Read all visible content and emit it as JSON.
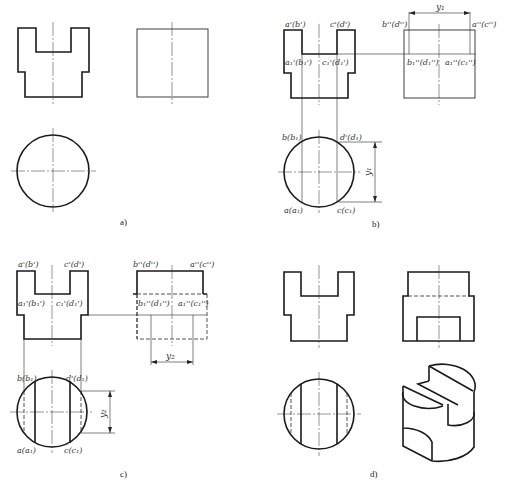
{
  "figure": {
    "panels": [
      {
        "id": "a",
        "caption": "a)"
      },
      {
        "id": "b",
        "caption": "b)",
        "front_labels": [
          "a'(b')",
          "c'(d')",
          "a1'(b1')",
          "c1'(d1')"
        ],
        "side_labels": [
          "b''(d'')",
          "a''(c'')",
          "b1''(d1'')",
          "a1''(c1'')"
        ],
        "top_labels": [
          "b(b1)",
          "d(d1)",
          "a(a1)",
          "c(c1)"
        ],
        "dimension": "y1"
      },
      {
        "id": "c",
        "caption": "c)",
        "front_labels": [
          "a'(b')",
          "c'(d')",
          "a1'(b1')",
          "c1'(d1')"
        ],
        "side_labels": [
          "b''(d'')",
          "a''(c'')",
          "b1''(d1'')",
          "a1''(c1'')"
        ],
        "top_labels": [
          "b(b1)",
          "d(d1)",
          "a(a1)",
          "c(c1)"
        ],
        "dimension": "y2"
      },
      {
        "id": "d",
        "caption": "d)"
      }
    ]
  },
  "labels": {
    "b": {
      "ap_bp": "a'(b')",
      "cp_dp": "c'(d')",
      "a1p_b1p": "a₁'(b₁')",
      "c1p_d1p": "c₁'(d₁')",
      "bpp_dpp": "b''(d'')",
      "app_cpp": "a''(c'')",
      "b1pp_d1pp": "b₁''(d₁'')",
      "a1pp_c1pp": "a₁''(c₁'')",
      "b_b1": "b(b₁)",
      "d_d1": "d'(d₁)",
      "a_a1": "a(a₁)",
      "c_c1": "c(c₁)",
      "dim": "y₁",
      "dim2": "y₁"
    },
    "c": {
      "ap_bp": "a'(b')",
      "cp_dp": "c'(d')",
      "a1p_b1p": "a₁'(b₁')",
      "c1p_d1p": "c₁'(d₁')",
      "bpp_dpp": "b''(d'')",
      "app_cpp": "a''(c'')",
      "b1pp_d1pp": "b₁''(d₁'')",
      "a1pp_c1pp": "a₁''(c₁'')",
      "b_b1": "b(b₁)",
      "d_d1": "d'(d₁)",
      "a_a1": "a(a₁)",
      "c_c1": "c(c₁)",
      "dim": "y₂",
      "dim2": "y₂"
    }
  },
  "captions": {
    "a": "a)",
    "b": "b)",
    "c": "c)",
    "d": "d)"
  }
}
